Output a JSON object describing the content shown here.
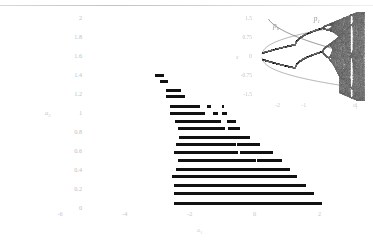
{
  "figure": {
    "kind": "parameter-space-diagram-with-bifurcation-inset",
    "background": "#ffffff",
    "bar_color": "#111111",
    "label_color": "#c3c3c3"
  },
  "main_axes": {
    "xlabel": "a₁",
    "ylabel": "a₂",
    "xlim": [
      -6,
      3
    ],
    "ylim": [
      0,
      2
    ],
    "xticks": [
      -6,
      -4,
      -2,
      0,
      2
    ],
    "xtick_labels": [
      "-6",
      "-4",
      "-2",
      "0",
      "2"
    ],
    "yticks": [
      0,
      0.2,
      0.4,
      0.6,
      0.8,
      1,
      1.2,
      1.4,
      1.6,
      1.8,
      2
    ],
    "ytick_labels": [
      "0",
      "0.2",
      "0.4",
      "0.6",
      "0.8",
      "1",
      "1.2",
      "1.4",
      "1.6",
      "1.8",
      "2"
    ],
    "grid": false
  },
  "inset_axes": {
    "xlabel": "a₁",
    "ylabel": "x",
    "xlim": [
      -2.6,
      1.3
    ],
    "ylim": [
      -1.75,
      1.75
    ],
    "xticks": [
      -2,
      -1,
      1
    ],
    "xtick_labels": [
      "-2",
      "-1",
      "1"
    ],
    "yticks": [
      1.5,
      0.75,
      0,
      -0.75,
      -1.5
    ],
    "ytick_labels": [
      "1.5",
      "0.75",
      "0",
      "-0.75",
      "-1.5"
    ],
    "annotations": [
      {
        "text": "p₀",
        "x": -2.18,
        "y": 1.05
      },
      {
        "text": "p₁",
        "x": -0.62,
        "y": 1.3
      }
    ]
  },
  "chart_data": {
    "type": "bar",
    "title": "",
    "xlabel": "a₁",
    "ylabel": "a₂",
    "xlim": [
      -6,
      3
    ],
    "ylim": [
      0,
      2
    ],
    "orientation": "horizontal",
    "rows": [
      {
        "a2": 1.4,
        "segments": [
          [
            -3.08,
            -2.8
          ]
        ]
      },
      {
        "a2": 1.33,
        "segments": [
          [
            -2.92,
            -2.66
          ]
        ]
      },
      {
        "a2": 1.24,
        "segments": [
          [
            -2.72,
            -2.28
          ]
        ]
      },
      {
        "a2": 1.17,
        "segments": [
          [
            -2.72,
            -2.16
          ]
        ]
      },
      {
        "a2": 1.07,
        "segments": [
          [
            -2.62,
            -1.7
          ],
          [
            -1.46,
            -1.34
          ],
          [
            -1.02,
            -0.94
          ]
        ]
      },
      {
        "a2": 1.0,
        "segments": [
          [
            -2.6,
            -1.52
          ],
          [
            -1.28,
            -1.12
          ],
          [
            -1.02,
            -0.84
          ]
        ]
      },
      {
        "a2": 0.91,
        "segments": [
          [
            -2.46,
            -1.04
          ],
          [
            -0.84,
            -0.56
          ]
        ]
      },
      {
        "a2": 0.84,
        "segments": [
          [
            -2.36,
            -0.9
          ],
          [
            -0.82,
            -0.44
          ]
        ]
      },
      {
        "a2": 0.74,
        "segments": [
          [
            -2.34,
            -0.7
          ],
          [
            -0.8,
            -0.14
          ]
        ]
      },
      {
        "a2": 0.67,
        "segments": [
          [
            -2.42,
            -0.56
          ],
          [
            -0.54,
            0.16
          ]
        ]
      },
      {
        "a2": 0.58,
        "segments": [
          [
            -2.5,
            -0.52
          ],
          [
            -0.44,
            0.58
          ]
        ]
      },
      {
        "a2": 0.5,
        "segments": [
          [
            -2.36,
            0.04
          ],
          [
            0.06,
            0.84
          ]
        ]
      },
      {
        "a2": 0.41,
        "segments": [
          [
            -2.44,
            1.08
          ]
        ]
      },
      {
        "a2": 0.33,
        "segments": [
          [
            -2.54,
            1.3
          ]
        ]
      },
      {
        "a2": 0.24,
        "segments": [
          [
            -2.48,
            1.58
          ]
        ]
      },
      {
        "a2": 0.15,
        "segments": [
          [
            -2.48,
            1.82
          ]
        ]
      },
      {
        "a2": 0.05,
        "segments": [
          [
            -2.48,
            2.06
          ]
        ]
      }
    ]
  },
  "inset_chart_data": {
    "type": "scatter",
    "title": "",
    "xlabel": "a₁",
    "ylabel": "x",
    "xlim": [
      -2.6,
      1.3
    ],
    "ylim": [
      -1.75,
      1.75
    ],
    "description": "Bifurcation diagram: period-doubling cascade into chaotic bands with periodic windows, bounded by envelope curves; branch point markers p0 and p1 on an overlaid curve."
  }
}
